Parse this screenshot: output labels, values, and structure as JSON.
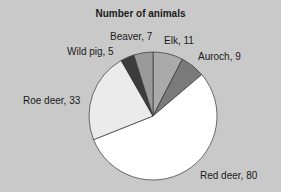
{
  "chart_data": {
    "type": "pie",
    "title": "Number of animals",
    "start_angle": "12 o'clock, clockwise",
    "slices": [
      {
        "label": "Elk",
        "value": 11,
        "color": "#aaaaaa",
        "text": "Elk, 11"
      },
      {
        "label": "Auroch",
        "value": 9,
        "color": "#7a7a7a",
        "text": "Auroch, 9"
      },
      {
        "label": "Red deer",
        "value": 80,
        "color": "#ffffff",
        "text": "Red deer, 80"
      },
      {
        "label": "Roe deer",
        "value": 33,
        "color": "#ebebeb",
        "text": "Roe deer, 33"
      },
      {
        "label": "Wild pig",
        "value": 5,
        "color": "#3c3c3c",
        "text": "Wild pig, 5"
      },
      {
        "label": "Beaver",
        "value": 7,
        "color": "#9a9a9a",
        "text": "Beaver, 7"
      }
    ],
    "legend": "none (inline labels)"
  }
}
